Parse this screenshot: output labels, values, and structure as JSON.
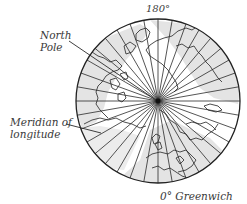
{
  "diagram": {
    "labels": {
      "top_meridian": "180°",
      "pole_line1": "North",
      "pole_line2": "Pole",
      "meridian_line1": "Meridian of",
      "meridian_line2": "longitude",
      "bottom_meridian": "0° Greenwich"
    },
    "globe": {
      "center_x": 158,
      "center_y": 101,
      "radius": 82,
      "meridian_spacing_deg": 10,
      "meridian_count": 36
    },
    "colors": {
      "ink": "#2a2a2a",
      "land_shade": "#e2e2e2",
      "sea": "#ffffff",
      "label_text": "#3a3a3a"
    }
  }
}
